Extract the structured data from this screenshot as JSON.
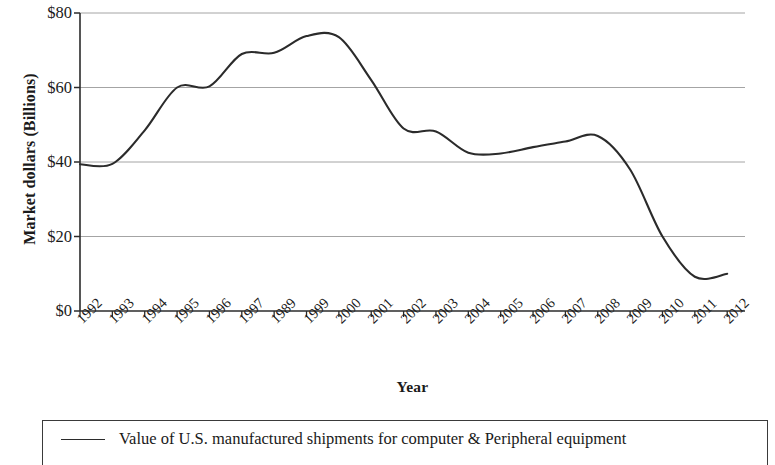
{
  "chart_data": {
    "type": "line",
    "title": "",
    "xlabel": "Year",
    "ylabel": "Market dollars (Billions)",
    "ylim": [
      0,
      80
    ],
    "ytick_labels": [
      "$80",
      "$60",
      "$40",
      "$20",
      "$0"
    ],
    "ytick_values": [
      80,
      60,
      40,
      20,
      0
    ],
    "grid": "horizontal",
    "legend_position": "bottom",
    "legend": [
      "Value of U.S. manufactured shipments for computer & Peripheral equipment"
    ],
    "categories": [
      "1992",
      "1993",
      "1994",
      "1995",
      "1996",
      "1997",
      "1989",
      "1999",
      "2000",
      "2001",
      "2002",
      "2003",
      "2004",
      "2005",
      "2006",
      "2007",
      "2008",
      "2009",
      "2010",
      "2011",
      "2012"
    ],
    "series": [
      {
        "name": "Value of U.S. manufactured shipments for computer & Peripheral equipment",
        "color": "#2b2b2b",
        "values": [
          39.4,
          39.5,
          48.5,
          60.0,
          60.3,
          69.0,
          69.3,
          73.8,
          73.5,
          62.0,
          49.0,
          48.2,
          42.5,
          42.3,
          44.0,
          45.5,
          47.0,
          38.0,
          20.0,
          9.2,
          10.0
        ]
      }
    ]
  },
  "axis": {
    "y_title": "Market dollars (Billions)",
    "x_title": "Year"
  },
  "legend": {
    "entry_label": "Value of U.S. manufactured shipments for computer & Peripheral equipment"
  }
}
